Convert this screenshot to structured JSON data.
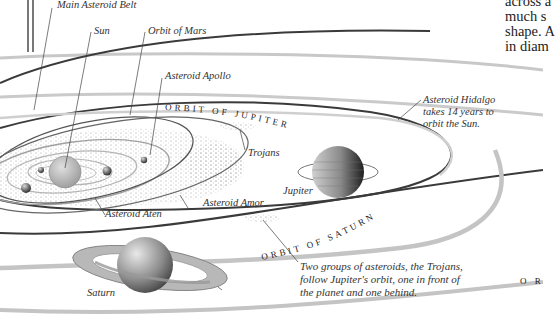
{
  "diagram": {
    "labels": {
      "main_belt": "Main Asteroid Belt",
      "sun": "Sun",
      "orbit_mars": "Orbit of Mars",
      "apollo": "Asteroid Apollo",
      "trojans": "Trojans",
      "jupiter": "Jupiter",
      "aten": "Asteroid Aten",
      "amor": "Asteroid Amor",
      "saturn": "Saturn",
      "hidalgo_1": "Asteroid Hidalgo",
      "hidalgo_2": "takes 14 years to",
      "hidalgo_3": "orbit the Sun.",
      "trojans_note_1": "Two groups of asteroids, the Trojans,",
      "trojans_note_2": "follow Jupiter's orbit, one in front of",
      "trojans_note_3": "the planet and one behind."
    },
    "orbit_titles": {
      "jupiter": "ORBIT OF JUPITER",
      "saturn": "ORBIT OF SATURN",
      "outer_partial": "O R"
    },
    "body_text_fragment": [
      "across a",
      "much s",
      "shape. A",
      "in diam"
    ],
    "colors": {
      "orbit_dark": "#3a3a3a",
      "orbit_light": "#c4c4c4",
      "sun": "#b5b5b5",
      "text": "#333333"
    }
  }
}
